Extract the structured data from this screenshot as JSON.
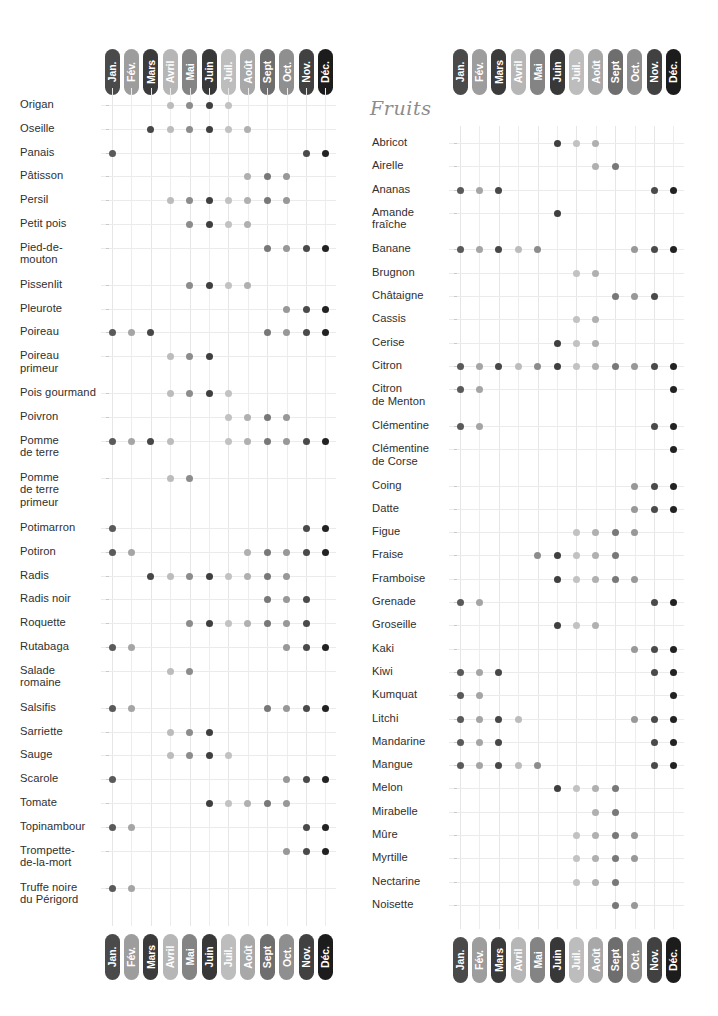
{
  "page": {
    "width": 718,
    "height": 1016,
    "background": "#ffffff"
  },
  "months": {
    "labels": [
      "Jan.",
      "Fév.",
      "Mars",
      "Avril",
      "Mai",
      "Juin",
      "Juil.",
      "Août",
      "Sept",
      "Oct.",
      "Nov.",
      "Déc."
    ],
    "pill_colors": [
      "#4a4a4a",
      "#9d9d9d",
      "#3b3b3b",
      "#b6b6b6",
      "#848484",
      "#383838",
      "#bdbdbd",
      "#a8a8a8",
      "#6e6e6e",
      "#8f8f8f",
      "#414141",
      "#1c1c1c"
    ],
    "dot_colors": [
      "#5a5a5a",
      "#a5a5a5",
      "#474747",
      "#bcbcbc",
      "#8c8c8c",
      "#3f3f3f",
      "#c2c2c2",
      "#b0b0b0",
      "#787878",
      "#989898",
      "#4a4a4a",
      "#222222"
    ]
  },
  "sections": {
    "fruits_title": "Fruits"
  },
  "chart_data": {
    "type": "heatmap",
    "xlabel": "Mois",
    "ylabel": "Produit",
    "categories": [
      "Jan.",
      "Fév.",
      "Mars",
      "Avril",
      "Mai",
      "Juin",
      "Juil.",
      "Août",
      "Sept",
      "Oct.",
      "Nov.",
      "Déc."
    ],
    "legend": [],
    "grid": true,
    "panels": [
      {
        "name": "legumes",
        "title": "",
        "rows": [
          {
            "label": "Origan",
            "months": [
              0,
              0,
              0,
              1,
              1,
              1,
              1,
              0,
              0,
              0,
              0,
              0
            ]
          },
          {
            "label": "Oseille",
            "months": [
              0,
              0,
              1,
              1,
              1,
              1,
              1,
              1,
              0,
              0,
              0,
              0
            ]
          },
          {
            "label": "Panais",
            "months": [
              1,
              0,
              0,
              0,
              0,
              0,
              0,
              0,
              0,
              0,
              1,
              1
            ]
          },
          {
            "label": "Pâtisson",
            "months": [
              0,
              0,
              0,
              0,
              0,
              0,
              0,
              1,
              1,
              1,
              0,
              0
            ]
          },
          {
            "label": "Persil",
            "months": [
              0,
              0,
              0,
              1,
              1,
              1,
              1,
              1,
              1,
              1,
              0,
              0
            ]
          },
          {
            "label": "Petit pois",
            "months": [
              0,
              0,
              0,
              0,
              1,
              1,
              1,
              1,
              0,
              0,
              0,
              0
            ]
          },
          {
            "label": "Pied-de-\nmouton",
            "months": [
              0,
              0,
              0,
              0,
              0,
              0,
              0,
              0,
              1,
              1,
              1,
              1
            ]
          },
          {
            "label": "Pissenlit",
            "months": [
              0,
              0,
              0,
              0,
              1,
              1,
              1,
              1,
              0,
              0,
              0,
              0
            ]
          },
          {
            "label": "Pleurote",
            "months": [
              0,
              0,
              0,
              0,
              0,
              0,
              0,
              0,
              0,
              1,
              1,
              1
            ]
          },
          {
            "label": "Poireau",
            "months": [
              1,
              1,
              1,
              0,
              0,
              0,
              0,
              0,
              1,
              1,
              1,
              1
            ]
          },
          {
            "label": "Poireau\nprimeur",
            "months": [
              0,
              0,
              0,
              1,
              1,
              1,
              0,
              0,
              0,
              0,
              0,
              0
            ]
          },
          {
            "label": "Pois gourmand",
            "months": [
              0,
              0,
              0,
              1,
              1,
              1,
              1,
              0,
              0,
              0,
              0,
              0
            ]
          },
          {
            "label": "Poivron",
            "months": [
              0,
              0,
              0,
              0,
              0,
              0,
              1,
              1,
              1,
              1,
              0,
              0
            ]
          },
          {
            "label": "Pomme\nde terre",
            "months": [
              1,
              1,
              1,
              1,
              0,
              0,
              1,
              1,
              1,
              1,
              1,
              1
            ]
          },
          {
            "label": "Pomme\nde terre\nprimeur",
            "months": [
              0,
              0,
              0,
              1,
              1,
              0,
              0,
              0,
              0,
              0,
              0,
              0
            ]
          },
          {
            "label": "Potimarron",
            "months": [
              1,
              0,
              0,
              0,
              0,
              0,
              0,
              0,
              0,
              0,
              1,
              1
            ]
          },
          {
            "label": "Potiron",
            "months": [
              1,
              1,
              0,
              0,
              0,
              0,
              0,
              1,
              1,
              1,
              1,
              1
            ]
          },
          {
            "label": "Radis",
            "months": [
              0,
              0,
              1,
              1,
              1,
              1,
              1,
              1,
              1,
              1,
              0,
              0
            ]
          },
          {
            "label": "Radis noir",
            "months": [
              0,
              0,
              0,
              0,
              0,
              0,
              0,
              0,
              1,
              1,
              1,
              0
            ]
          },
          {
            "label": "Roquette",
            "months": [
              0,
              0,
              0,
              0,
              1,
              1,
              1,
              1,
              1,
              1,
              1,
              0
            ]
          },
          {
            "label": "Rutabaga",
            "months": [
              1,
              1,
              0,
              0,
              0,
              0,
              0,
              0,
              0,
              1,
              1,
              1
            ]
          },
          {
            "label": "Salade\nromaine",
            "months": [
              0,
              0,
              0,
              1,
              1,
              0,
              0,
              0,
              0,
              0,
              0,
              0
            ]
          },
          {
            "label": "Salsifis",
            "months": [
              1,
              1,
              0,
              0,
              0,
              0,
              0,
              0,
              1,
              1,
              1,
              1
            ]
          },
          {
            "label": "Sarriette",
            "months": [
              0,
              0,
              0,
              1,
              1,
              1,
              0,
              0,
              0,
              0,
              0,
              0
            ]
          },
          {
            "label": "Sauge",
            "months": [
              0,
              0,
              0,
              1,
              1,
              1,
              1,
              0,
              0,
              0,
              0,
              0
            ]
          },
          {
            "label": "Scarole",
            "months": [
              1,
              0,
              0,
              0,
              0,
              0,
              0,
              0,
              0,
              1,
              1,
              1
            ]
          },
          {
            "label": "Tomate",
            "months": [
              0,
              0,
              0,
              0,
              0,
              1,
              1,
              1,
              1,
              1,
              0,
              0
            ]
          },
          {
            "label": "Topinambour",
            "months": [
              1,
              1,
              0,
              0,
              0,
              0,
              0,
              0,
              0,
              0,
              1,
              1
            ]
          },
          {
            "label": "Trompette-\nde-la-mort",
            "months": [
              0,
              0,
              0,
              0,
              0,
              0,
              0,
              0,
              0,
              1,
              1,
              1
            ]
          },
          {
            "label": "Truffe noire\ndu Périgord",
            "months": [
              1,
              1,
              0,
              0,
              0,
              0,
              0,
              0,
              0,
              0,
              0,
              0
            ]
          }
        ]
      },
      {
        "name": "fruits",
        "title": "Fruits",
        "rows": [
          {
            "label": "Abricot",
            "months": [
              0,
              0,
              0,
              0,
              0,
              1,
              1,
              1,
              0,
              0,
              0,
              0
            ]
          },
          {
            "label": "Airelle",
            "months": [
              0,
              0,
              0,
              0,
              0,
              0,
              0,
              1,
              1,
              0,
              0,
              0
            ]
          },
          {
            "label": "Ananas",
            "months": [
              1,
              1,
              1,
              0,
              0,
              0,
              0,
              0,
              0,
              0,
              1,
              1
            ]
          },
          {
            "label": "Amande\nfraîche",
            "months": [
              0,
              0,
              0,
              0,
              0,
              1,
              0,
              0,
              0,
              0,
              0,
              0
            ]
          },
          {
            "label": "Banane",
            "months": [
              1,
              1,
              1,
              1,
              1,
              0,
              0,
              0,
              0,
              1,
              1,
              1
            ]
          },
          {
            "label": "Brugnon",
            "months": [
              0,
              0,
              0,
              0,
              0,
              0,
              1,
              1,
              0,
              0,
              0,
              0
            ]
          },
          {
            "label": "Châtaigne",
            "months": [
              0,
              0,
              0,
              0,
              0,
              0,
              0,
              0,
              1,
              1,
              1,
              0
            ]
          },
          {
            "label": "Cassis",
            "months": [
              0,
              0,
              0,
              0,
              0,
              0,
              1,
              1,
              0,
              0,
              0,
              0
            ]
          },
          {
            "label": "Cerise",
            "months": [
              0,
              0,
              0,
              0,
              0,
              1,
              1,
              1,
              0,
              0,
              0,
              0
            ]
          },
          {
            "label": "Citron",
            "months": [
              1,
              1,
              1,
              1,
              1,
              1,
              1,
              1,
              1,
              1,
              1,
              1
            ]
          },
          {
            "label": "Citron\nde Menton",
            "months": [
              1,
              1,
              0,
              0,
              0,
              0,
              0,
              0,
              0,
              0,
              0,
              1
            ]
          },
          {
            "label": "Clémentine",
            "months": [
              1,
              1,
              0,
              0,
              0,
              0,
              0,
              0,
              0,
              0,
              1,
              1
            ]
          },
          {
            "label": "Clémentine\nde Corse",
            "months": [
              0,
              0,
              0,
              0,
              0,
              0,
              0,
              0,
              0,
              0,
              0,
              1
            ]
          },
          {
            "label": "Coing",
            "months": [
              0,
              0,
              0,
              0,
              0,
              0,
              0,
              0,
              0,
              1,
              1,
              1
            ]
          },
          {
            "label": "Datte",
            "months": [
              0,
              0,
              0,
              0,
              0,
              0,
              0,
              0,
              0,
              1,
              1,
              1
            ]
          },
          {
            "label": "Figue",
            "months": [
              0,
              0,
              0,
              0,
              0,
              0,
              1,
              1,
              1,
              1,
              0,
              0
            ]
          },
          {
            "label": "Fraise",
            "months": [
              0,
              0,
              0,
              0,
              1,
              1,
              1,
              1,
              1,
              0,
              0,
              0
            ]
          },
          {
            "label": "Framboise",
            "months": [
              0,
              0,
              0,
              0,
              0,
              1,
              1,
              1,
              1,
              1,
              0,
              0
            ]
          },
          {
            "label": "Grenade",
            "months": [
              1,
              1,
              0,
              0,
              0,
              0,
              0,
              0,
              0,
              0,
              1,
              1
            ]
          },
          {
            "label": "Groseille",
            "months": [
              0,
              0,
              0,
              0,
              0,
              1,
              1,
              1,
              0,
              0,
              0,
              0
            ]
          },
          {
            "label": "Kaki",
            "months": [
              0,
              0,
              0,
              0,
              0,
              0,
              0,
              0,
              0,
              1,
              1,
              1
            ]
          },
          {
            "label": "Kiwi",
            "months": [
              1,
              1,
              1,
              0,
              0,
              0,
              0,
              0,
              0,
              0,
              1,
              1
            ]
          },
          {
            "label": "Kumquat",
            "months": [
              1,
              1,
              0,
              0,
              0,
              0,
              0,
              0,
              0,
              0,
              0,
              1
            ]
          },
          {
            "label": "Litchi",
            "months": [
              1,
              1,
              1,
              1,
              0,
              0,
              0,
              0,
              0,
              1,
              1,
              1
            ]
          },
          {
            "label": "Mandarine",
            "months": [
              1,
              1,
              1,
              0,
              0,
              0,
              0,
              0,
              0,
              0,
              1,
              1
            ]
          },
          {
            "label": "Mangue",
            "months": [
              1,
              1,
              1,
              1,
              1,
              0,
              0,
              0,
              0,
              0,
              1,
              1
            ]
          },
          {
            "label": "Melon",
            "months": [
              0,
              0,
              0,
              0,
              0,
              1,
              1,
              1,
              1,
              0,
              0,
              0
            ]
          },
          {
            "label": "Mirabelle",
            "months": [
              0,
              0,
              0,
              0,
              0,
              0,
              0,
              1,
              1,
              0,
              0,
              0
            ]
          },
          {
            "label": "Mûre",
            "months": [
              0,
              0,
              0,
              0,
              0,
              0,
              1,
              1,
              1,
              1,
              0,
              0
            ]
          },
          {
            "label": "Myrtille",
            "months": [
              0,
              0,
              0,
              0,
              0,
              0,
              1,
              1,
              1,
              1,
              0,
              0
            ]
          },
          {
            "label": "Nectarine",
            "months": [
              0,
              0,
              0,
              0,
              0,
              0,
              1,
              1,
              1,
              0,
              0,
              0
            ]
          },
          {
            "label": "Noisette",
            "months": [
              0,
              0,
              0,
              0,
              0,
              0,
              0,
              0,
              1,
              1,
              0,
              0
            ]
          }
        ]
      }
    ]
  }
}
